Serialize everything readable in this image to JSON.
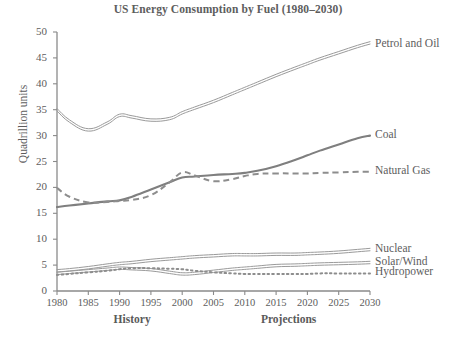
{
  "chart_data": {
    "type": "line",
    "title": "US Energy Consumption by Fuel (1980–2030)",
    "xlabel": "",
    "ylabel": "Quadrillion units",
    "xlim": [
      1980,
      2030
    ],
    "ylim": [
      0,
      50
    ],
    "grid": false,
    "legend_position": "right-inline-labels",
    "x_ticks": [
      "1980",
      "1985",
      "1990",
      "1995",
      "2000",
      "2005",
      "2010",
      "2015",
      "2020",
      "2025",
      "2030"
    ],
    "y_ticks": [
      "0",
      "5",
      "10",
      "15",
      "20",
      "25",
      "30",
      "35",
      "40",
      "45",
      "50"
    ],
    "period_labels": [
      {
        "text": "History",
        "center_year": 1992
      },
      {
        "text": "Projections",
        "center_year": 2017
      }
    ],
    "x": [
      1980,
      1982,
      1985,
      1988,
      1990,
      1992,
      1995,
      1998,
      2000,
      2002,
      2005,
      2008,
      2010,
      2012,
      2015,
      2018,
      2020,
      2022,
      2025,
      2028,
      2030
    ],
    "series": [
      {
        "name": "Petrol and Oil",
        "style": "solid-double",
        "color": "#9a9a9a",
        "label_year": 2030,
        "label_value": 47.5,
        "values": [
          35.0,
          32.8,
          31.1,
          32.4,
          33.9,
          33.6,
          33.0,
          33.3,
          34.4,
          35.3,
          36.6,
          38.1,
          39.1,
          40.1,
          41.6,
          43.0,
          43.9,
          44.8,
          46.0,
          47.2,
          47.9
        ]
      },
      {
        "name": "Coal",
        "style": "solid",
        "color": "#7f7f7f",
        "label_year": 2030,
        "label_value": 30.0,
        "values": [
          16.2,
          16.5,
          16.9,
          17.3,
          17.5,
          18.2,
          19.6,
          21.0,
          21.9,
          22.1,
          22.4,
          22.6,
          22.8,
          23.2,
          24.1,
          25.3,
          26.2,
          27.1,
          28.3,
          29.5,
          30.0
        ]
      },
      {
        "name": "Natural Gas",
        "style": "dashed",
        "color": "#8d8d8d",
        "label_year": 2030,
        "label_value": 23.0,
        "values": [
          19.9,
          18.2,
          17.1,
          17.2,
          17.4,
          17.6,
          18.5,
          21.0,
          22.9,
          22.3,
          21.2,
          21.6,
          22.2,
          22.6,
          22.7,
          22.7,
          22.7,
          22.8,
          22.9,
          23.0,
          23.0
        ]
      },
      {
        "name": "Nuclear",
        "style": "solid-double",
        "color": "#9a9a9a",
        "label_year": 2030,
        "label_value": 8.0,
        "values": [
          3.9,
          4.1,
          4.5,
          5.0,
          5.3,
          5.5,
          5.9,
          6.2,
          6.4,
          6.6,
          6.8,
          7.0,
          7.0,
          7.0,
          7.1,
          7.1,
          7.2,
          7.3,
          7.5,
          7.8,
          8.0
        ]
      },
      {
        "name": "Solar/Wind",
        "style": "solid-double",
        "color": "#9a9a9a",
        "label_year": 2030,
        "label_value": 5.5,
        "values": [
          3.4,
          3.6,
          3.9,
          4.2,
          4.4,
          4.3,
          4.1,
          3.6,
          3.3,
          3.4,
          3.8,
          4.2,
          4.4,
          4.6,
          4.9,
          5.0,
          5.1,
          5.2,
          5.3,
          5.4,
          5.5
        ]
      },
      {
        "name": "Hydropower",
        "style": "dotted",
        "color": "#8d8d8d",
        "label_year": 2030,
        "label_value": 3.4,
        "values": [
          3.1,
          3.3,
          3.6,
          3.9,
          4.2,
          4.4,
          4.4,
          4.3,
          4.2,
          3.9,
          3.6,
          3.4,
          3.3,
          3.3,
          3.3,
          3.3,
          3.3,
          3.4,
          3.4,
          3.4,
          3.4
        ]
      }
    ]
  },
  "axis": {
    "line_color": "#8a8a8a"
  }
}
